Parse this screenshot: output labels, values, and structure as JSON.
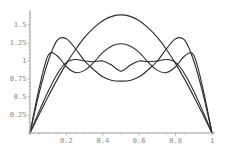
{
  "chart_data": {
    "type": "line",
    "title": "",
    "xlabel": "",
    "ylabel": "",
    "xlim": [
      0,
      1
    ],
    "ylim": [
      0,
      1.65
    ],
    "grid": false,
    "legend": null,
    "x_ticks": [
      {
        "value": 0.2,
        "label": "0.2"
      },
      {
        "value": 0.4,
        "label": "0.4"
      },
      {
        "value": 0.6,
        "label": "0.6"
      },
      {
        "value": 0.8,
        "label": "0.8"
      },
      {
        "value": 1,
        "label": "1"
      }
    ],
    "y_ticks": [
      {
        "value": 0.25,
        "label": "0.25"
      },
      {
        "value": 0.5,
        "label": "0.5"
      },
      {
        "value": 0.75,
        "label": "0.75"
      },
      {
        "value": 1,
        "label": "1"
      },
      {
        "value": 1.25,
        "label": "1.25"
      },
      {
        "value": 1.5,
        "label": "1.5"
      }
    ],
    "x": [
      0,
      0.05,
      0.1,
      0.15,
      0.2,
      0.25,
      0.3,
      0.35,
      0.4,
      0.45,
      0.5,
      0.55,
      0.6,
      0.65,
      0.7,
      0.75,
      0.8,
      0.85,
      0.9,
      0.95,
      1
    ],
    "series": [
      {
        "name": "curve-1",
        "values": [
          0,
          0.256,
          0.507,
          0.745,
          0.964,
          1.16,
          1.327,
          1.461,
          1.56,
          1.62,
          1.64,
          1.62,
          1.56,
          1.461,
          1.327,
          1.16,
          0.964,
          0.745,
          0.507,
          0.256,
          0
        ]
      },
      {
        "name": "curve-2",
        "values": [
          0,
          0.55,
          1.0,
          1.29,
          1.31,
          1.17,
          1.0,
          0.88,
          0.78,
          0.73,
          0.72,
          0.73,
          0.78,
          0.88,
          1.0,
          1.17,
          1.31,
          1.29,
          1.0,
          0.55,
          0
        ]
      },
      {
        "name": "curve-3",
        "values": [
          0,
          0.62,
          1.08,
          1.07,
          0.92,
          0.84,
          0.87,
          0.98,
          1.12,
          1.21,
          1.24,
          1.21,
          1.12,
          0.98,
          0.87,
          0.84,
          0.92,
          1.07,
          1.08,
          0.62,
          0
        ]
      },
      {
        "name": "curve-4",
        "values": [
          0,
          0.3,
          0.58,
          0.82,
          0.98,
          1.02,
          1.0,
          0.99,
          1.0,
          0.94,
          0.86,
          0.94,
          1.0,
          0.99,
          1.0,
          1.02,
          0.98,
          0.82,
          0.58,
          0.3,
          0
        ]
      }
    ]
  },
  "colors": {
    "axis": "#9a9a9a",
    "curve": "#2a2a2a",
    "background": "#ffffff"
  }
}
